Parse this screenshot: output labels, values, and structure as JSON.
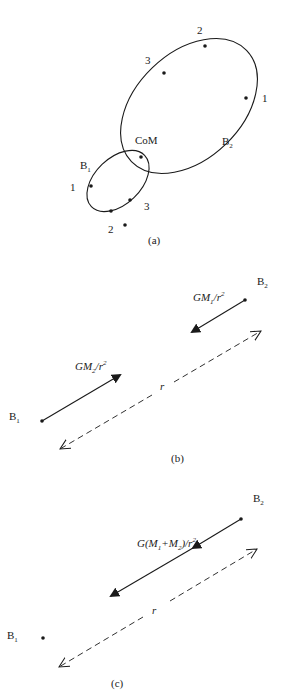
{
  "panels": {
    "a": {
      "caption": "(a)",
      "com_label": "CoM",
      "body1": {
        "label": "B",
        "sub": "1",
        "points": [
          "1",
          "2",
          "3"
        ]
      },
      "body2": {
        "label": "B",
        "sub": "2",
        "points": [
          "1",
          "2",
          "3"
        ]
      }
    },
    "b": {
      "caption": "(b)",
      "b1": {
        "label": "B",
        "sub": "1"
      },
      "b2": {
        "label": "B",
        "sub": "2"
      },
      "force_on_b1": {
        "pre": "GM",
        "sub": "2",
        "post": "/r",
        "sup": "2"
      },
      "force_on_b2": {
        "pre": "GM",
        "sub": "1",
        "post": "/r",
        "sup": "2"
      },
      "distance_label": "r"
    },
    "c": {
      "caption": "(c)",
      "b1": {
        "label": "B",
        "sub": "1"
      },
      "b2": {
        "label": "B",
        "sub": "2"
      },
      "relative_force": {
        "p1": "G(M",
        "s1": "1",
        "p2": "+M",
        "s2": "2",
        "p3": ")/r",
        "sup": "2"
      },
      "distance_label": "r"
    }
  },
  "colors": {
    "ink": "#1a1a1a",
    "background": "#ffffff"
  }
}
